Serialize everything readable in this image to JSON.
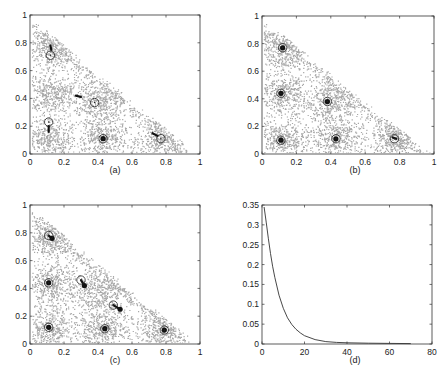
{
  "chart_data": [
    {
      "id": "a",
      "type": "scatter",
      "caption": "(a)",
      "xlim": [
        0,
        1
      ],
      "ylim": [
        0,
        1
      ],
      "xticks": [
        "0",
        "0.2",
        "0.4",
        "0.6",
        "0.8",
        "1"
      ],
      "yticks": [
        "0",
        "0.2",
        "0.4",
        "0.6",
        "0.8",
        "1"
      ],
      "data_region": "triangle x>=0, y>=0, x+y<=1",
      "point_color": "#a8a8a8",
      "clusters": [
        [
          0.12,
          0.76
        ],
        [
          0.12,
          0.44
        ],
        [
          0.4,
          0.38
        ],
        [
          0.43,
          0.12
        ],
        [
          0.77,
          0.11
        ],
        [
          0.12,
          0.11
        ]
      ],
      "circles": [
        [
          0.12,
          0.71
        ],
        [
          0.11,
          0.23
        ],
        [
          0.38,
          0.37
        ],
        [
          0.43,
          0.11
        ],
        [
          0.77,
          0.11
        ]
      ],
      "trajectories": [
        [
          [
            0.12,
            0.78
          ],
          [
            0.125,
            0.75
          ]
        ],
        [
          [
            0.11,
            0.2
          ],
          [
            0.11,
            0.16
          ]
        ],
        [
          [
            0.27,
            0.42
          ],
          [
            0.3,
            0.41
          ]
        ],
        [
          [
            0.72,
            0.15
          ],
          [
            0.75,
            0.13
          ]
        ]
      ],
      "filled_markers": [
        [
          0.43,
          0.11
        ]
      ],
      "grid": false
    },
    {
      "id": "b",
      "type": "scatter",
      "caption": "(b)",
      "xlim": [
        0,
        1
      ],
      "ylim": [
        0,
        1
      ],
      "xticks": [
        "0",
        "0.2",
        "0.4",
        "0.6",
        "0.8",
        "1"
      ],
      "yticks": [
        "0",
        "0.2",
        "0.4",
        "0.6",
        "0.8",
        "1"
      ],
      "point_color": "#a8a8a8",
      "clusters": [
        [
          0.12,
          0.76
        ],
        [
          0.12,
          0.44
        ],
        [
          0.4,
          0.38
        ],
        [
          0.43,
          0.12
        ],
        [
          0.77,
          0.11
        ],
        [
          0.12,
          0.11
        ]
      ],
      "circles": [
        [
          0.12,
          0.77
        ],
        [
          0.11,
          0.44
        ],
        [
          0.38,
          0.38
        ],
        [
          0.43,
          0.11
        ],
        [
          0.77,
          0.11
        ],
        [
          0.11,
          0.1
        ]
      ],
      "trajectories": [
        [
          [
            0.76,
            0.12
          ],
          [
            0.78,
            0.11
          ]
        ]
      ],
      "filled_markers": [
        [
          0.12,
          0.77
        ],
        [
          0.11,
          0.44
        ],
        [
          0.38,
          0.38
        ],
        [
          0.43,
          0.11
        ],
        [
          0.11,
          0.1
        ]
      ],
      "grid": false
    },
    {
      "id": "c",
      "type": "scatter",
      "caption": "(c)",
      "xlim": [
        0,
        1
      ],
      "ylim": [
        0,
        1
      ],
      "xticks": [
        "0",
        "0.2",
        "0.4",
        "0.6",
        "0.8",
        "1"
      ],
      "yticks": [
        "0",
        "0.2",
        "0.4",
        "0.6",
        "0.8",
        "1"
      ],
      "point_color": "#a8a8a8",
      "clusters": [
        [
          0.12,
          0.76
        ],
        [
          0.12,
          0.44
        ],
        [
          0.4,
          0.38
        ],
        [
          0.43,
          0.12
        ],
        [
          0.77,
          0.11
        ],
        [
          0.12,
          0.11
        ]
      ],
      "circles": [
        [
          0.11,
          0.78
        ],
        [
          0.11,
          0.44
        ],
        [
          0.3,
          0.46
        ],
        [
          0.49,
          0.28
        ],
        [
          0.44,
          0.11
        ],
        [
          0.79,
          0.1
        ],
        [
          0.11,
          0.12
        ]
      ],
      "trajectories": [
        [
          [
            0.11,
            0.78
          ],
          [
            0.13,
            0.76
          ]
        ],
        [
          [
            0.3,
            0.46
          ],
          [
            0.32,
            0.42
          ]
        ],
        [
          [
            0.49,
            0.28
          ],
          [
            0.53,
            0.25
          ]
        ]
      ],
      "filled_markers": [
        [
          0.13,
          0.76
        ],
        [
          0.11,
          0.44
        ],
        [
          0.32,
          0.42
        ],
        [
          0.53,
          0.25
        ],
        [
          0.44,
          0.11
        ],
        [
          0.79,
          0.1
        ],
        [
          0.11,
          0.12
        ]
      ],
      "grid": false
    },
    {
      "id": "d",
      "type": "line",
      "caption": "(d)",
      "xlim": [
        0,
        80
      ],
      "ylim": [
        0,
        0.35
      ],
      "xticks": [
        "0",
        "20",
        "40",
        "60",
        "80"
      ],
      "yticks": [
        "0",
        "0.05",
        "0.1",
        "0.15",
        "0.2",
        "0.25",
        "0.3",
        "0.35"
      ],
      "series": [
        {
          "name": "curve",
          "x": [
            1,
            2,
            3,
            4,
            5,
            6,
            8,
            10,
            12,
            14,
            16,
            18,
            20,
            25,
            30,
            35,
            40,
            50,
            60,
            70
          ],
          "y": [
            0.345,
            0.305,
            0.265,
            0.228,
            0.196,
            0.168,
            0.123,
            0.09,
            0.066,
            0.049,
            0.037,
            0.028,
            0.021,
            0.011,
            0.006,
            0.004,
            0.003,
            0.002,
            0.0015,
            0.001
          ]
        }
      ],
      "grid": false
    }
  ],
  "panels": {
    "a": {
      "caption": "(a)"
    },
    "b": {
      "caption": "(b)"
    },
    "c": {
      "caption": "(c)"
    },
    "d": {
      "caption": "(d)"
    }
  }
}
